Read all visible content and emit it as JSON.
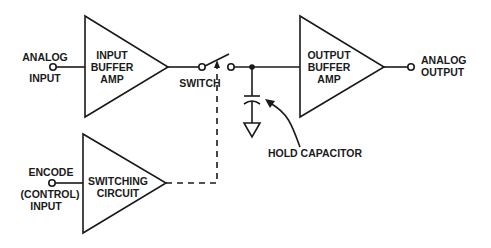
{
  "diagram": {
    "blocks": [
      {
        "id": "input_buffer",
        "lines": [
          "INPUT",
          "BUFFER",
          "AMP"
        ]
      },
      {
        "id": "output_buffer",
        "lines": [
          "OUTPUT",
          "BUFFER",
          "AMP"
        ]
      },
      {
        "id": "switching_circuit",
        "lines": [
          "SWITCHING",
          "CIRCUIT"
        ]
      }
    ],
    "labels": {
      "analog_input": [
        "ANALOG",
        "INPUT"
      ],
      "analog_output": [
        "ANALOG",
        "OUTPUT"
      ],
      "encode_input": [
        "ENCODE",
        "(CONTROL)",
        "INPUT"
      ],
      "switch": "SWITCH",
      "hold_capacitor": "HOLD CAPACITOR"
    },
    "connections": [
      {
        "from": "analog_input",
        "to": "input_buffer",
        "style": "solid"
      },
      {
        "from": "input_buffer",
        "to": "switch",
        "style": "solid"
      },
      {
        "from": "switch",
        "to": "output_buffer",
        "style": "solid"
      },
      {
        "from": "switch_node",
        "to": "hold_capacitor",
        "style": "solid"
      },
      {
        "from": "hold_capacitor",
        "to": "ground",
        "style": "solid"
      },
      {
        "from": "output_buffer",
        "to": "analog_output",
        "style": "solid"
      },
      {
        "from": "encode_input",
        "to": "switching_circuit",
        "style": "solid"
      },
      {
        "from": "switching_circuit",
        "to": "switch",
        "style": "dashed"
      }
    ]
  }
}
